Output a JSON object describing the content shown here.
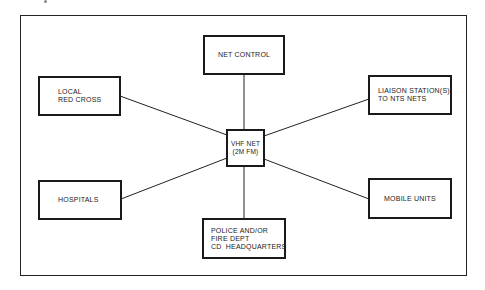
{
  "diagram": {
    "center": {
      "id": "vhf-net",
      "label": "VHF NET\n(2M FM)"
    },
    "nodes": [
      {
        "id": "net-control",
        "label": "NET CONTROL"
      },
      {
        "id": "local-red-cross",
        "label": "LOCAL\nRED CROSS"
      },
      {
        "id": "liaison-stations",
        "label": "LIAISON STATION(S)\nTO NTS NETS"
      },
      {
        "id": "hospitals",
        "label": "HOSPITALS"
      },
      {
        "id": "mobile-units",
        "label": "MOBILE UNITS"
      },
      {
        "id": "police-fire-cd",
        "label": "POLICE AND/OR\nFIRE DEPT\nCD  HEADQUARTERS"
      }
    ],
    "edges": [
      {
        "from": "vhf-net",
        "to": "net-control"
      },
      {
        "from": "vhf-net",
        "to": "local-red-cross"
      },
      {
        "from": "vhf-net",
        "to": "liaison-stations"
      },
      {
        "from": "vhf-net",
        "to": "hospitals"
      },
      {
        "from": "vhf-net",
        "to": "mobile-units"
      },
      {
        "from": "vhf-net",
        "to": "police-fire-cd"
      }
    ],
    "colors": {
      "line": "#222222",
      "background": "#ffffff"
    }
  }
}
